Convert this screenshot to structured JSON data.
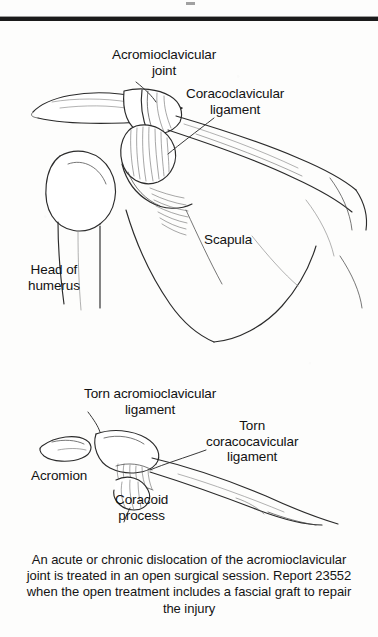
{
  "figure": {
    "type": "anatomical-line-illustration",
    "top_rule": true
  },
  "upper_diagram": {
    "name": "normal-shoulder-anatomy",
    "labels": [
      {
        "id": "ac-joint",
        "text": "Acromioclavicular\njoint"
      },
      {
        "id": "cc-ligament",
        "text": "Coracoclavicular\nligament"
      },
      {
        "id": "scapula",
        "text": "Scapula"
      },
      {
        "id": "head-humerus",
        "text": "Head of\nhumerus"
      }
    ]
  },
  "lower_diagram": {
    "name": "dislocated-joint-anatomy",
    "labels": [
      {
        "id": "torn-ac",
        "text": "Torn acromioclavicular\nligament"
      },
      {
        "id": "torn-cc",
        "text": "Torn\ncoracocavicular\nligament"
      },
      {
        "id": "acromion",
        "text": "Acromion"
      },
      {
        "id": "coracoid",
        "text": "Coracoid\nprocess"
      }
    ]
  },
  "caption": {
    "text": "An acute or chronic dislocation of the acromioclavicular joint is treated in an open surgical session. Report 23552 when the open treatment includes a fascial graft to repair the injury",
    "code": "23552"
  },
  "colors": {
    "paper": "#fdfdfc",
    "ink": "#2b2b2b",
    "text": "#141414",
    "rule": "#1b1b1b"
  }
}
